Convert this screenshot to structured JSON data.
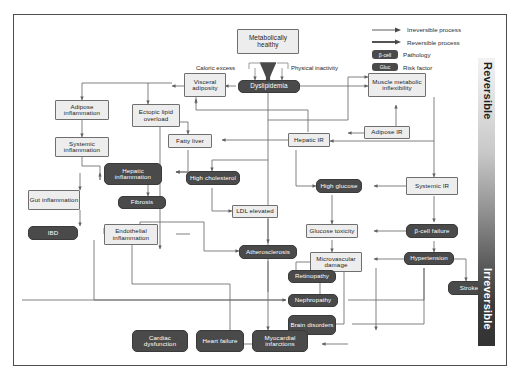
{
  "diagram": {
    "colors": {
      "pathology_node": "#4a4a4a",
      "risk_factor_node": "#ededed",
      "frame_border": "#4d4d4d",
      "edge": "#6b6b6b"
    }
  },
  "legend": {
    "items": [
      {
        "glyph": "thin-arrow",
        "label": "Irreversible process"
      },
      {
        "glyph": "thick-arrow",
        "label": "Reversible process"
      },
      {
        "glyph": "dark-badge",
        "badge": "β-cell",
        "label": "Pathology"
      },
      {
        "glyph": "dark-badge",
        "badge": "Gluc",
        "label": "Risk factor"
      }
    ]
  },
  "axis": {
    "top_label": "Reversible",
    "bottom_label": "Irreversible"
  },
  "edge_labels": [
    {
      "id": "caloric-excess",
      "text": "Caloric excess"
    },
    {
      "id": "physical-inactivity",
      "text": "Physical inactivity"
    }
  ],
  "nodes": [
    {
      "id": "metabolically-healthy",
      "text": "Metabolically healthy",
      "kind": "risk-factor"
    },
    {
      "id": "visceral-adiposity",
      "text": "Visceral adiposity",
      "kind": "risk-factor"
    },
    {
      "id": "dyslipidemia",
      "text": "Dyslipidemia",
      "kind": "pathology"
    },
    {
      "id": "muscle-metabolic-inflexibility",
      "text": "Muscle metabolic inflexibility",
      "kind": "risk-factor"
    },
    {
      "id": "adipose-inflammation",
      "text": "Adipose inflammation",
      "kind": "risk-factor"
    },
    {
      "id": "ectopic-lipid-overload",
      "text": "Ectopic lipid overload",
      "kind": "risk-factor"
    },
    {
      "id": "adipose-ir",
      "text": "Adipose IR",
      "kind": "risk-factor"
    },
    {
      "id": "fatty-liver",
      "text": "Fatty liver",
      "kind": "risk-factor"
    },
    {
      "id": "hepatic-ir",
      "text": "Hepatic IR",
      "kind": "risk-factor"
    },
    {
      "id": "systemic-inflammation",
      "text": "Systemic inflammation",
      "kind": "risk-factor"
    },
    {
      "id": "hepatic-inflammation",
      "text": "Hepatic inflammation",
      "kind": "pathology"
    },
    {
      "id": "high-cholesterol",
      "text": "High cholesterol",
      "kind": "pathology"
    },
    {
      "id": "high-glucose",
      "text": "High glucose",
      "kind": "pathology"
    },
    {
      "id": "systemic-ir",
      "text": "Systemic IR",
      "kind": "risk-factor"
    },
    {
      "id": "gut-inflammation",
      "text": "Gut inflammation",
      "kind": "risk-factor"
    },
    {
      "id": "fibrosis",
      "text": "Fibrosis",
      "kind": "pathology"
    },
    {
      "id": "ldl-elevated",
      "text": "LDL elevated",
      "kind": "risk-factor"
    },
    {
      "id": "ibd",
      "text": "IBD",
      "kind": "pathology"
    },
    {
      "id": "endothelial-inflammation",
      "text": "Endothelial inflammation",
      "kind": "risk-factor"
    },
    {
      "id": "atherosclerosis",
      "text": "Atherosclerosis",
      "kind": "pathology"
    },
    {
      "id": "glucose-toxicity",
      "text": "Glucose toxicity",
      "kind": "risk-factor"
    },
    {
      "id": "beta-cell-failure",
      "text": "β-cell failure",
      "kind": "pathology"
    },
    {
      "id": "microvascular-damage",
      "text": "Microvascular damage",
      "kind": "risk-factor"
    },
    {
      "id": "retinopathy",
      "text": "Retinopathy",
      "kind": "pathology"
    },
    {
      "id": "hypertension",
      "text": "Hypertension",
      "kind": "pathology"
    },
    {
      "id": "nephropathy",
      "text": "Nephropathy",
      "kind": "pathology"
    },
    {
      "id": "stroke",
      "text": "Stroke",
      "kind": "pathology"
    },
    {
      "id": "brain-disorders",
      "text": "Brain disorders",
      "kind": "pathology"
    },
    {
      "id": "cardiac-dysfunction",
      "text": "Cardiac dysfunction",
      "kind": "pathology"
    },
    {
      "id": "heart-failure",
      "text": "Heart failure",
      "kind": "pathology"
    },
    {
      "id": "myocardial-infarctions",
      "text": "Myocardial infarctions",
      "kind": "pathology"
    }
  ]
}
